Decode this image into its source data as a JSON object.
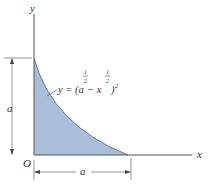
{
  "figure": {
    "axes": {
      "x_label": "x",
      "y_label": "y",
      "origin_label": "O"
    },
    "curve": {
      "equation_prefix": "y = (a",
      "exp1": "1",
      "exp1_den": "2",
      "minus": " − x",
      "exp2": "1",
      "exp2_den": "2",
      "close": ")",
      "outer_exp": "2"
    },
    "dimensions": {
      "vertical": "a",
      "horizontal": "a"
    },
    "colors": {
      "fill": "#a9bfd9",
      "stroke": "#4a6a93",
      "axis": "#444444"
    }
  }
}
